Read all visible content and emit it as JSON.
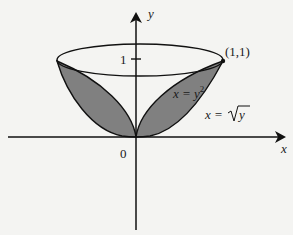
{
  "diagram": {
    "axes": {
      "x_label": "x",
      "y_label": "y",
      "origin_label": "0",
      "y_tick_label": "1"
    },
    "point_label": "(1,1)",
    "curves": [
      {
        "name": "parabola-x-equals-y-squared",
        "label_lhs": "x = y",
        "label_exp": "2"
      },
      {
        "name": "curve-x-equals-sqrt-y",
        "label_lhs": "x = ",
        "label_rad": "y"
      }
    ],
    "colors": {
      "shaded_region": "#808080",
      "stroke": "#111111",
      "background": "#f4f4f2"
    }
  }
}
